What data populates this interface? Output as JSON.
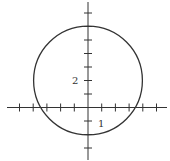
{
  "chart_data": {
    "type": "diagram",
    "title": "",
    "circle": {
      "center": [
        0,
        2
      ],
      "radius": 4
    },
    "axes": {
      "x": {
        "range": [
          -6,
          6
        ],
        "ticks": [
          -5,
          -4,
          -3,
          -2,
          -1,
          1,
          2,
          3,
          4,
          5
        ],
        "labeled_ticks": [
          {
            "value": 1,
            "label": "1"
          }
        ]
      },
      "y": {
        "range": [
          -4,
          7.5
        ],
        "ticks": [
          -3,
          -2,
          -1,
          1,
          2,
          3,
          4,
          5,
          6,
          7
        ],
        "labeled_ticks": [
          {
            "value": 2,
            "label": "2"
          }
        ]
      }
    },
    "grid": false
  },
  "labels": {
    "y_tick_2": "2",
    "x_tick_1": "1"
  },
  "colors": {
    "stroke": "#333333",
    "background": "#ffffff"
  }
}
